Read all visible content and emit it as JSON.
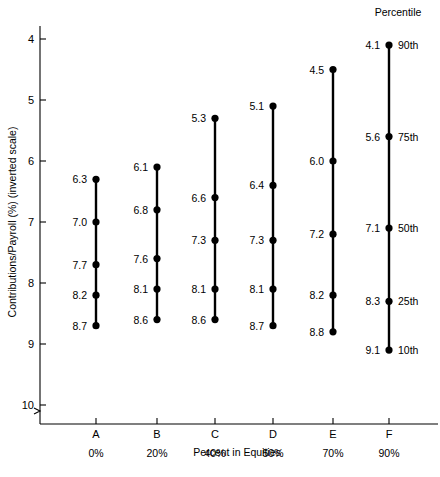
{
  "chart_data": {
    "type": "scatter",
    "title": "",
    "xlabel": "Percent in Equities",
    "ylabel": "Contributions/Payroll (%) (inverted scale)",
    "inverted_yaxis": true,
    "ylim": [
      4,
      10
    ],
    "yticks": [
      4,
      5,
      6,
      7,
      8,
      9,
      10
    ],
    "ytick_labels": [
      "4",
      "5",
      "6",
      "7",
      "8",
      "9",
      "10"
    ],
    "grid": false,
    "legend_title": "Percentile",
    "legend_position": "top-right",
    "percentiles": [
      "90th",
      "75th",
      "50th",
      "25th",
      "10th"
    ],
    "categories": [
      "A",
      "B",
      "C",
      "D",
      "E",
      "F"
    ],
    "category_sublabels": [
      "0%",
      "20%",
      "40%",
      "50%",
      "70%",
      "90%"
    ],
    "series": [
      {
        "name": "90th",
        "values": [
          6.3,
          6.1,
          5.3,
          5.1,
          4.5,
          4.1
        ]
      },
      {
        "name": "75th",
        "values": [
          7.0,
          6.8,
          6.6,
          6.4,
          6.0,
          5.6
        ]
      },
      {
        "name": "50th",
        "values": [
          7.7,
          7.6,
          7.3,
          7.3,
          7.2,
          7.1
        ]
      },
      {
        "name": "25th",
        "values": [
          8.2,
          8.1,
          8.1,
          8.1,
          8.2,
          8.3
        ]
      },
      {
        "name": "10th",
        "values": [
          8.7,
          8.6,
          8.6,
          8.7,
          8.8,
          9.1
        ]
      }
    ],
    "columns": [
      {
        "label": "A",
        "sublabel": "0%",
        "values": [
          6.3,
          7.0,
          7.7,
          8.2,
          8.7
        ]
      },
      {
        "label": "B",
        "sublabel": "20%",
        "values": [
          6.1,
          6.8,
          7.6,
          8.1,
          8.6
        ]
      },
      {
        "label": "C",
        "sublabel": "40%",
        "values": [
          5.3,
          6.6,
          7.3,
          8.1,
          8.6
        ]
      },
      {
        "label": "D",
        "sublabel": "50%",
        "values": [
          5.1,
          6.4,
          7.3,
          8.1,
          8.7
        ]
      },
      {
        "label": "E",
        "sublabel": "70%",
        "values": [
          4.5,
          6.0,
          7.2,
          8.2,
          8.8
        ]
      },
      {
        "label": "F",
        "sublabel": "90%",
        "values": [
          4.1,
          5.6,
          7.1,
          8.3,
          9.1
        ]
      }
    ]
  }
}
